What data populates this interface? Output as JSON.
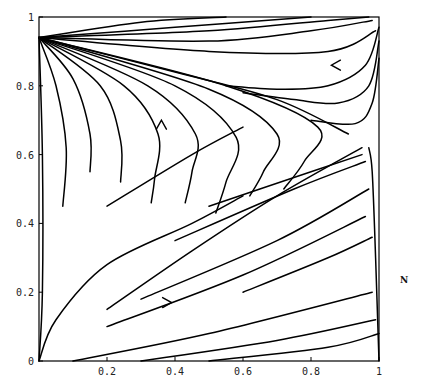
{
  "chart_data": {
    "type": "line",
    "subtype": "phase-portrait",
    "title": "",
    "xlabel": "",
    "ylabel": "",
    "side_label": "N",
    "xlim": [
      0,
      1
    ],
    "ylim": [
      0,
      1
    ],
    "x_ticks": [
      "0.2",
      "0.4",
      "0.6",
      "0.8",
      "1"
    ],
    "x_tick_values": [
      0.2,
      0.4,
      0.6,
      0.8,
      1.0
    ],
    "y_ticks": [
      "0",
      "0.2",
      "0.4",
      "0.6",
      "0.8",
      "1"
    ],
    "y_tick_values": [
      0,
      0.2,
      0.4,
      0.6,
      0.8,
      1.0
    ],
    "grid": false,
    "legend": null,
    "equilibria": [
      {
        "x": 0.0,
        "y": 0.94,
        "kind": "source"
      },
      {
        "x": 0.91,
        "y": 0.66,
        "kind": "saddle"
      },
      {
        "x": 0.97,
        "y": 0.6,
        "kind": "stable"
      }
    ],
    "arrows": [
      {
        "x": 0.36,
        "y": 0.7,
        "direction": "up"
      },
      {
        "x": 0.39,
        "y": 0.17,
        "direction": "right"
      },
      {
        "x": 0.86,
        "y": 0.86,
        "direction": "left"
      }
    ],
    "series": [
      {
        "name": "top-fan-1",
        "points": [
          [
            0.0,
            0.94
          ],
          [
            0.3,
            0.985
          ],
          [
            0.55,
            1.0
          ]
        ]
      },
      {
        "name": "top-fan-2",
        "points": [
          [
            0.0,
            0.94
          ],
          [
            0.4,
            0.97
          ],
          [
            0.8,
            1.0
          ]
        ]
      },
      {
        "name": "top-fan-3",
        "points": [
          [
            0.0,
            0.94
          ],
          [
            0.5,
            0.96
          ],
          [
            0.85,
            0.99
          ],
          [
            0.97,
            1.0
          ]
        ]
      },
      {
        "name": "top-fan-4",
        "points": [
          [
            0.0,
            0.94
          ],
          [
            0.5,
            0.93
          ],
          [
            0.8,
            0.96
          ],
          [
            0.98,
            0.99
          ]
        ]
      },
      {
        "name": "top-fan-5",
        "points": [
          [
            0.0,
            0.94
          ],
          [
            0.5,
            0.9
          ],
          [
            0.85,
            0.9
          ],
          [
            0.99,
            0.96
          ]
        ]
      },
      {
        "name": "upper-right-return-1",
        "points": [
          [
            1.0,
            0.97
          ],
          [
            0.96,
            0.86
          ],
          [
            0.85,
            0.8
          ],
          [
            0.7,
            0.79
          ],
          [
            0.55,
            0.8
          ]
        ]
      },
      {
        "name": "upper-right-return-2",
        "points": [
          [
            1.0,
            0.93
          ],
          [
            0.97,
            0.8
          ],
          [
            0.88,
            0.75
          ],
          [
            0.75,
            0.76
          ],
          [
            0.6,
            0.78
          ]
        ]
      },
      {
        "name": "upper-right-return-3",
        "points": [
          [
            1.0,
            0.88
          ],
          [
            0.98,
            0.75
          ],
          [
            0.93,
            0.69
          ],
          [
            0.8,
            0.7
          ]
        ]
      },
      {
        "name": "separatrix-upper",
        "points": [
          [
            0.0,
            0.94
          ],
          [
            0.4,
            0.84
          ],
          [
            0.7,
            0.76
          ],
          [
            0.91,
            0.66
          ]
        ]
      },
      {
        "name": "hairpin-1",
        "points": [
          [
            0.0,
            0.94
          ],
          [
            0.55,
            0.8
          ],
          [
            0.82,
            0.68
          ],
          [
            0.78,
            0.58
          ],
          [
            0.72,
            0.5
          ]
        ]
      },
      {
        "name": "hairpin-2",
        "points": [
          [
            0.0,
            0.94
          ],
          [
            0.5,
            0.79
          ],
          [
            0.7,
            0.66
          ],
          [
            0.66,
            0.55
          ],
          [
            0.62,
            0.48
          ]
        ]
      },
      {
        "name": "hairpin-3",
        "points": [
          [
            0.0,
            0.94
          ],
          [
            0.4,
            0.8
          ],
          [
            0.58,
            0.65
          ],
          [
            0.55,
            0.52
          ],
          [
            0.52,
            0.43
          ]
        ]
      },
      {
        "name": "hairpin-4",
        "points": [
          [
            0.0,
            0.94
          ],
          [
            0.32,
            0.8
          ],
          [
            0.46,
            0.66
          ],
          [
            0.45,
            0.55
          ],
          [
            0.43,
            0.46
          ]
        ]
      },
      {
        "name": "hairpin-5",
        "points": [
          [
            0.0,
            0.94
          ],
          [
            0.25,
            0.8
          ],
          [
            0.35,
            0.66
          ],
          [
            0.34,
            0.53
          ],
          [
            0.33,
            0.46
          ]
        ]
      },
      {
        "name": "hairpin-6",
        "points": [
          [
            0.0,
            0.94
          ],
          [
            0.18,
            0.8
          ],
          [
            0.24,
            0.64
          ],
          [
            0.24,
            0.52
          ]
        ]
      },
      {
        "name": "hairpin-7",
        "points": [
          [
            0.0,
            0.94
          ],
          [
            0.1,
            0.82
          ],
          [
            0.15,
            0.66
          ],
          [
            0.15,
            0.55
          ]
        ]
      },
      {
        "name": "hairpin-8",
        "points": [
          [
            0.0,
            0.94
          ],
          [
            0.05,
            0.8
          ],
          [
            0.08,
            0.62
          ],
          [
            0.07,
            0.45
          ]
        ]
      },
      {
        "name": "left-wall",
        "points": [
          [
            0.0,
            0.94
          ],
          [
            0.01,
            0.6
          ],
          [
            0.01,
            0.2
          ],
          [
            0.0,
            0.0
          ]
        ]
      },
      {
        "name": "lower-curve-1",
        "points": [
          [
            0.0,
            0.0
          ],
          [
            0.05,
            0.12
          ],
          [
            0.2,
            0.28
          ],
          [
            0.45,
            0.4
          ],
          [
            0.6,
            0.48
          ]
        ]
      },
      {
        "name": "diag-1",
        "points": [
          [
            0.2,
            0.15
          ],
          [
            0.45,
            0.32
          ],
          [
            0.7,
            0.48
          ],
          [
            0.95,
            0.62
          ]
        ]
      },
      {
        "name": "diag-2",
        "points": [
          [
            0.2,
            0.45
          ],
          [
            0.45,
            0.6
          ],
          [
            0.6,
            0.68
          ]
        ]
      },
      {
        "name": "ray-1",
        "points": [
          [
            0.2,
            0.1
          ],
          [
            0.6,
            0.25
          ],
          [
            0.96,
            0.42
          ]
        ]
      },
      {
        "name": "ray-2",
        "points": [
          [
            0.3,
            0.18
          ],
          [
            0.7,
            0.35
          ],
          [
            0.97,
            0.5
          ]
        ]
      },
      {
        "name": "ray-3",
        "points": [
          [
            0.1,
            0.0
          ],
          [
            0.5,
            0.08
          ],
          [
            0.98,
            0.2
          ]
        ]
      },
      {
        "name": "ray-4",
        "points": [
          [
            0.3,
            0.0
          ],
          [
            0.7,
            0.06
          ],
          [
            0.99,
            0.12
          ]
        ]
      },
      {
        "name": "ray-5",
        "points": [
          [
            0.5,
            0.0
          ],
          [
            0.85,
            0.04
          ],
          [
            1.0,
            0.08
          ]
        ]
      },
      {
        "name": "ray-6",
        "points": [
          [
            0.4,
            0.35
          ],
          [
            0.75,
            0.5
          ],
          [
            0.96,
            0.58
          ]
        ]
      },
      {
        "name": "ray-7",
        "points": [
          [
            0.6,
            0.2
          ],
          [
            0.85,
            0.3
          ],
          [
            0.98,
            0.36
          ]
        ]
      },
      {
        "name": "ray-8",
        "points": [
          [
            0.5,
            0.45
          ],
          [
            0.8,
            0.55
          ],
          [
            0.95,
            0.6
          ]
        ]
      },
      {
        "name": "right-wall",
        "points": [
          [
            1.0,
            0.0
          ],
          [
            0.99,
            0.3
          ],
          [
            0.98,
            0.55
          ],
          [
            0.97,
            0.62
          ]
        ]
      }
    ]
  }
}
